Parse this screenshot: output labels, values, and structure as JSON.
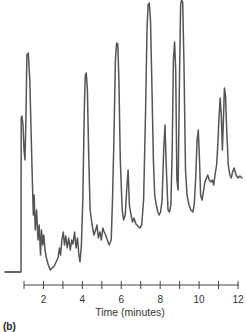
{
  "panel_label": "(b)",
  "chart_data": {
    "type": "line",
    "title": "",
    "xlabel": "Time (minutes)",
    "ylabel": "",
    "xlim": [
      1,
      12
    ],
    "x_ticks": [
      1,
      2,
      3,
      4,
      5,
      6,
      7,
      8,
      9,
      10,
      11,
      12
    ],
    "x_tick_labels": [
      "2",
      "4",
      "6",
      "8",
      "10",
      "12"
    ],
    "x_tick_label_values": [
      2,
      4,
      6,
      8,
      10,
      12
    ],
    "grid": false,
    "legend": null,
    "y_axis_visible": false,
    "series": [
      {
        "name": "chromatogram",
        "color": "#555555",
        "x": [
          0.05,
          0.85,
          0.86,
          0.9,
          0.95,
          1.0,
          1.05,
          1.1,
          1.15,
          1.22,
          1.3,
          1.4,
          1.48,
          1.52,
          1.58,
          1.65,
          1.72,
          1.78,
          1.85,
          1.9,
          1.96,
          2.02,
          2.08,
          2.15,
          2.25,
          2.35,
          2.45,
          2.55,
          2.65,
          2.75,
          2.82,
          2.88,
          2.95,
          3.02,
          3.08,
          3.15,
          3.22,
          3.3,
          3.38,
          3.45,
          3.52,
          3.6,
          3.68,
          3.75,
          3.82,
          3.88,
          3.95,
          4.02,
          4.1,
          4.15,
          4.2,
          4.26,
          4.32,
          4.4,
          4.5,
          4.6,
          4.68,
          4.75,
          4.82,
          4.9,
          4.98,
          5.05,
          5.12,
          5.2,
          5.28,
          5.38,
          5.48,
          5.55,
          5.62,
          5.7,
          5.76,
          5.82,
          5.88,
          5.95,
          6.05,
          6.12,
          6.2,
          6.28,
          6.35,
          6.42,
          6.5,
          6.58,
          6.65,
          6.75,
          6.85,
          6.95,
          7.05,
          7.15,
          7.25,
          7.32,
          7.38,
          7.44,
          7.5,
          7.58,
          7.65,
          7.72,
          7.8,
          7.88,
          7.95,
          8.02,
          8.1,
          8.18,
          8.25,
          8.32,
          8.4,
          8.48,
          8.55,
          8.62,
          8.68,
          8.74,
          8.8,
          8.86,
          8.92,
          8.98,
          9.05,
          9.1,
          9.16,
          9.22,
          9.3,
          9.38,
          9.48,
          9.58,
          9.68,
          9.75,
          9.82,
          9.9,
          9.96,
          10.02,
          10.08,
          10.15,
          10.22,
          10.3,
          10.38,
          10.45,
          10.52,
          10.6,
          10.68,
          10.75,
          10.82,
          10.9,
          10.96,
          11.02,
          11.08,
          11.14,
          11.2,
          11.25,
          11.3,
          11.36,
          11.42,
          11.5,
          11.58,
          11.65,
          11.72,
          11.8,
          11.9,
          12.0,
          12.1,
          12.2
        ],
        "y_px": [
          272,
          272,
          118,
          116,
          125,
          150,
          160,
          120,
          55,
          53,
          80,
          160,
          215,
          195,
          230,
          210,
          240,
          225,
          255,
          230,
          245,
          235,
          250,
          258,
          265,
          270,
          268,
          266,
          262,
          258,
          248,
          255,
          240,
          232,
          245,
          236,
          248,
          238,
          250,
          240,
          244,
          232,
          248,
          238,
          255,
          262,
          245,
          200,
          110,
          75,
          73,
          90,
          150,
          210,
          225,
          235,
          230,
          225,
          238,
          232,
          240,
          228,
          232,
          235,
          240,
          245,
          240,
          200,
          140,
          60,
          43,
          44,
          80,
          160,
          210,
          220,
          215,
          190,
          170,
          205,
          215,
          222,
          218,
          224,
          226,
          228,
          225,
          200,
          110,
          30,
          5,
          3,
          20,
          90,
          160,
          195,
          205,
          212,
          215,
          212,
          200,
          150,
          125,
          170,
          210,
          212,
          205,
          150,
          60,
          42,
          70,
          180,
          190,
          100,
          5,
          0,
          2,
          60,
          170,
          195,
          205,
          210,
          212,
          205,
          180,
          140,
          130,
          160,
          195,
          200,
          192,
          182,
          178,
          175,
          180,
          182,
          180,
          185,
          175,
          165,
          145,
          120,
          98,
          115,
          150,
          120,
          88,
          95,
          130,
          165,
          175,
          178,
          172,
          168,
          175,
          178,
          176,
          178,
          180,
          178
        ]
      }
    ],
    "notable_peaks_minutes": [
      1.25,
      4.2,
      5.8,
      7.4,
      8.7,
      9.1,
      10.0,
      11.0,
      11.2
    ]
  }
}
